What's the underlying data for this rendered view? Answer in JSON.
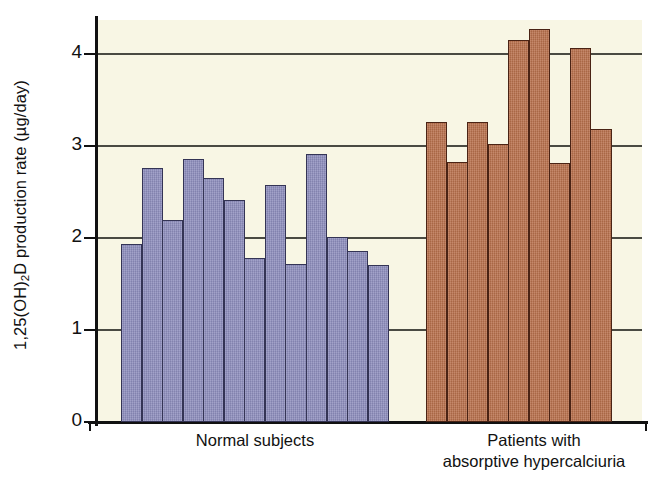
{
  "chart_data": {
    "type": "bar",
    "title": "",
    "subtitle": "",
    "xlabel": "",
    "ylabel": "1,25(OH)2D production rate (µg/day)",
    "ylabel_parts": {
      "prefix": "1,25(OH)",
      "subscript": "2",
      "suffix": "D production rate (µg/day)"
    },
    "ylim": [
      0,
      4.4
    ],
    "yticks": [
      0,
      1,
      2,
      3,
      4
    ],
    "ytick_labels": [
      "0",
      "1",
      "2",
      "3",
      "4"
    ],
    "grid": "horizontal",
    "legend": "none",
    "groups": [
      {
        "name": "normal-subjects",
        "label": "Normal subjects",
        "label_lines": [
          "Normal subjects"
        ],
        "color": "#8f8fbe",
        "edge_color": "#343455",
        "count": 13,
        "values": [
          1.93,
          2.76,
          2.2,
          2.86,
          2.65,
          2.41,
          1.78,
          2.58,
          1.72,
          2.91,
          2.01,
          1.86,
          1.71
        ]
      },
      {
        "name": "patients-absorptive-hypercalciuria",
        "label": "Patients with absorptive hypercalciuria",
        "label_lines": [
          "Patients with",
          "absorptive hypercalciuria"
        ],
        "color": "#b9714d",
        "edge_color": "#4a2314",
        "count": 9,
        "values": [
          3.26,
          2.83,
          3.26,
          3.02,
          4.15,
          4.27,
          2.82,
          4.07,
          3.19
        ]
      }
    ],
    "colors": {
      "plot_background": "#f8f6e4",
      "figure_background": "#ffffff",
      "axis": "#111111",
      "gridline": "#4a4a42",
      "series_normal": "#8f8fbe",
      "series_patients": "#b9714d"
    }
  }
}
